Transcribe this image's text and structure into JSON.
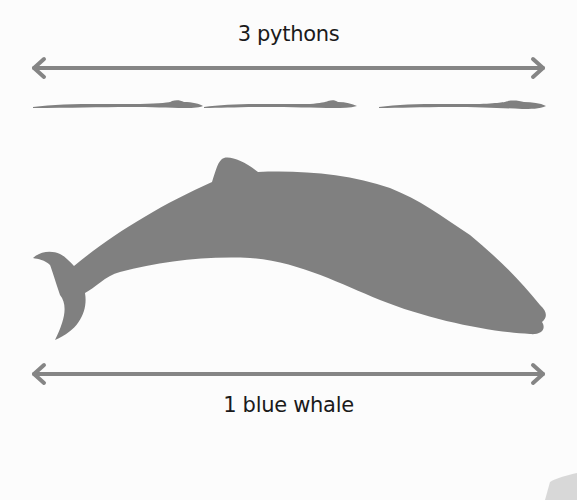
{
  "top_label": "3 pythons",
  "bottom_label": "1 blue whale",
  "colors": {
    "background": "#fcfcfc",
    "silhouette": "#808080",
    "arrow": "#858585",
    "text": "#1a1a1a",
    "corner_tab": "#d8d8d8"
  },
  "comparison": {
    "python_count": 3,
    "whale_count": 1
  }
}
